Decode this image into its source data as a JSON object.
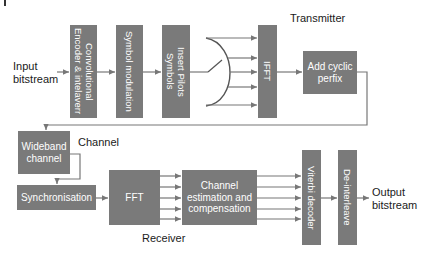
{
  "colors": {
    "block_fill": "#7a7a7a",
    "block_text": "#ffffff",
    "wire": "#777777",
    "label_text": "#1a1a1a"
  },
  "labels": {
    "input": "Input\nbitstream",
    "output": "Output\nbitstream",
    "transmitter": "Transmitter",
    "channel": "Channel",
    "receiver": "Receiver"
  },
  "transmitter": {
    "blocks": [
      {
        "id": "conv-encoder",
        "label": "Convolutional\nEncoder & intelaverr",
        "orientation": "vertical"
      },
      {
        "id": "symbol-mod",
        "label": "Symbol modulation",
        "orientation": "vertical"
      },
      {
        "id": "insert-pilots",
        "label": "Insert Pilots\nSymbols",
        "orientation": "vertical"
      },
      {
        "id": "ifft",
        "label": "IFFT",
        "orientation": "vertical"
      },
      {
        "id": "add-cp",
        "label": "Add cyclic\nperfix",
        "orientation": "horizontal"
      }
    ],
    "switch_outputs": 5
  },
  "channel": {
    "blocks": [
      {
        "id": "wideband",
        "label": "Wideband\nchannel"
      }
    ]
  },
  "receiver": {
    "blocks": [
      {
        "id": "sync",
        "label": "Synchronisation"
      },
      {
        "id": "fft",
        "label": "FFT"
      },
      {
        "id": "chan-est",
        "label": "Channel\nestimation and\ncompensation"
      },
      {
        "id": "viterbi",
        "label": "Viterbi decoder",
        "orientation": "vertical"
      },
      {
        "id": "deinterleave",
        "label": "De-interleave",
        "orientation": "vertical"
      }
    ],
    "parallel_lines": 5
  }
}
